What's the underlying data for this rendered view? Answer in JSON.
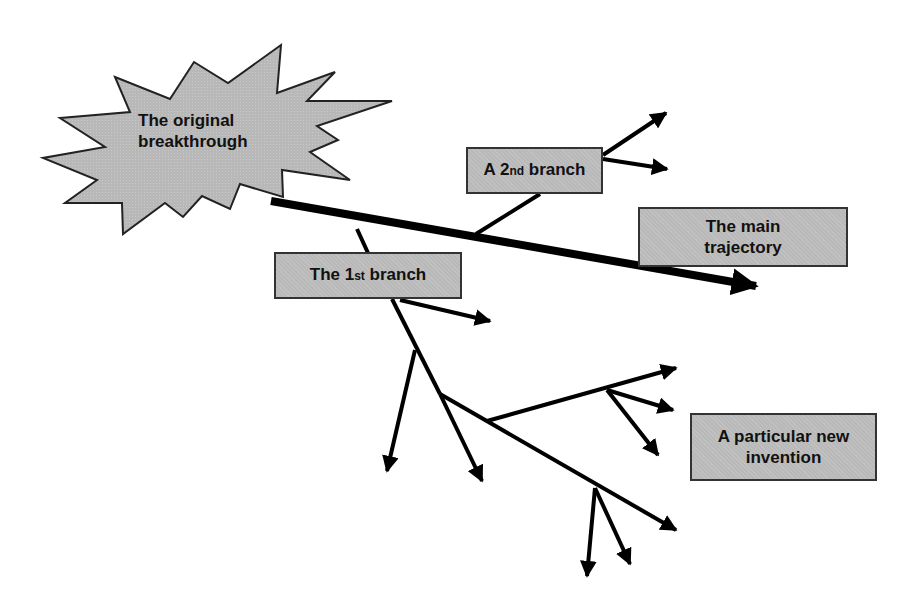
{
  "diagram": {
    "type": "branching trajectory diagram",
    "colors": {
      "box_fill": "#b9b9b9",
      "line": "#000000",
      "border": "#333333",
      "background": "#ffffff"
    },
    "nodes": {
      "origin": {
        "line1": "The original",
        "line2": "breakthrough",
        "shape": "starburst"
      },
      "main": {
        "line1": "The main",
        "line2": "trajectory"
      },
      "branch2": {
        "prefix": "A 2",
        "sup": "nd",
        "suffix": " branch"
      },
      "branch1": {
        "prefix": "The 1",
        "sup": "st",
        "suffix": " branch"
      },
      "invention": {
        "line1": "A particular new",
        "line2": "invention"
      }
    },
    "edges": [
      {
        "from": "origin",
        "to": "main",
        "label": "main trajectory arrow"
      },
      {
        "from": "main",
        "to": "branch2"
      },
      {
        "from": "origin-area",
        "to": "branch1"
      },
      {
        "from": "branch1",
        "to": "sub-branches"
      },
      {
        "from": "sub-branches",
        "to": "invention"
      }
    ]
  }
}
